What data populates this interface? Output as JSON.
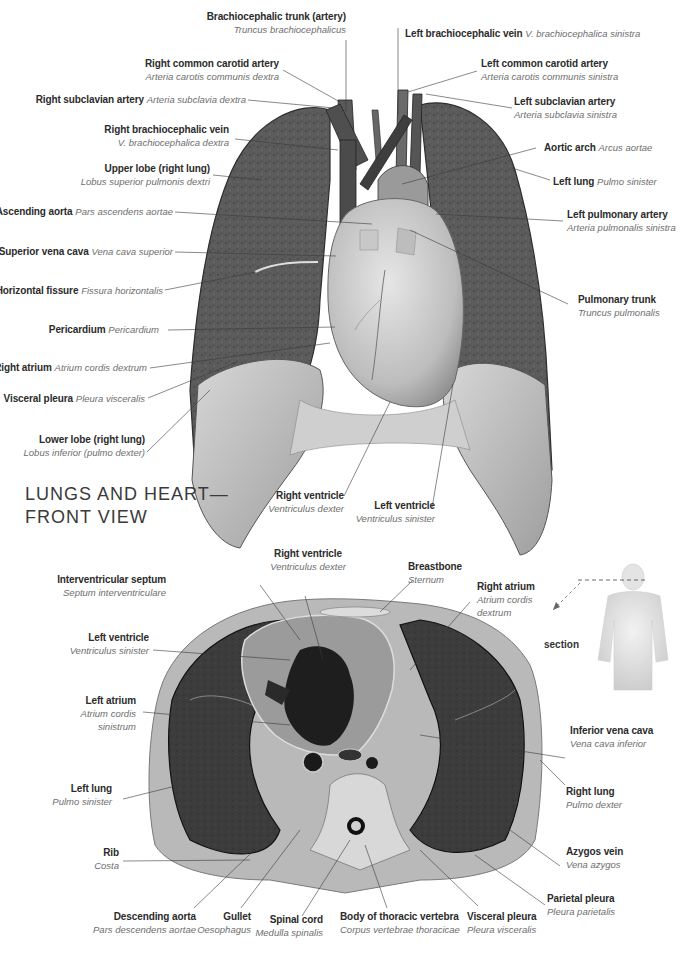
{
  "front_view": {
    "title_line1": "LUNGS AND HEART—",
    "title_line2": "FRONT VIEW",
    "labels": [
      {
        "id": "brachiocephalic-trunk",
        "en": "Brachiocephalic trunk (artery)",
        "la": "Truncus brachiocephalicus"
      },
      {
        "id": "right-common-carotid",
        "en": "Right common carotid artery",
        "la": "Arteria carotis communis dextra"
      },
      {
        "id": "right-subclavian",
        "en": "Right subclavian artery",
        "la": "Arteria subclavia dextra"
      },
      {
        "id": "right-brachiocephalic-vein",
        "en": "Right brachiocephalic vein",
        "la": "V. brachiocephalica dextra"
      },
      {
        "id": "upper-lobe",
        "en": "Upper lobe (right lung)",
        "la": "Lobus superior pulmonis dextri"
      },
      {
        "id": "ascending-aorta",
        "en": "Ascending aorta",
        "la": "Pars ascendens aortae"
      },
      {
        "id": "superior-vena-cava",
        "en": "Superior vena cava",
        "la": "Vena cava superior"
      },
      {
        "id": "horizontal-fissure",
        "en": "Horizontal fissure",
        "la": "Fissura horizontalis"
      },
      {
        "id": "pericardium",
        "en": "Pericardium",
        "la": "Pericardium"
      },
      {
        "id": "right-atrium",
        "en": "Right atrium",
        "la": "Atrium cordis dextrum"
      },
      {
        "id": "visceral-pleura",
        "en": "Visceral pleura",
        "la": "Pleura visceralis"
      },
      {
        "id": "lower-lobe",
        "en": "Lower lobe (right lung)",
        "la": "Lobus inferior (pulmo dexter)"
      },
      {
        "id": "left-brachiocephalic-vein",
        "en": "Left brachiocephalic vein",
        "la": "V. brachiocephalica sinistra"
      },
      {
        "id": "left-common-carotid",
        "en": "Left common carotid artery",
        "la": "Arteria carotis communis sinistra"
      },
      {
        "id": "left-subclavian",
        "en": "Left subclavian artery",
        "la": "Arteria subclavia sinistra"
      },
      {
        "id": "aortic-arch",
        "en": "Aortic arch",
        "la": "Arcus aortae"
      },
      {
        "id": "left-lung",
        "en": "Left lung",
        "la": "Pulmo sinister"
      },
      {
        "id": "left-pulmonary-artery",
        "en": "Left pulmonary artery",
        "la": "Arteria pulmonalis sinistra"
      },
      {
        "id": "pulmonary-trunk",
        "en": "Pulmonary trunk",
        "la": "Truncus pulmonalis"
      },
      {
        "id": "right-ventricle",
        "en": "Right ventricle",
        "la": "Ventriculus dexter"
      },
      {
        "id": "left-ventricle",
        "en": "Left ventricle",
        "la": "Ventriculus sinister"
      }
    ]
  },
  "cross_section": {
    "section_label": "section",
    "labels": [
      {
        "id": "right-ventricle",
        "en": "Right ventricle",
        "la": "Ventriculus dexter"
      },
      {
        "id": "interventricular-septum",
        "en": "Interventricular septum",
        "la": "Septum interventriculare"
      },
      {
        "id": "breastbone",
        "en": "Breastbone",
        "la": "Sternum"
      },
      {
        "id": "right-atrium",
        "en": "Right atrium",
        "la_1": "Atrium cordis",
        "la_2": "dextrum"
      },
      {
        "id": "left-ventricle",
        "en": "Left ventricle",
        "la": "Ventriculus sinister"
      },
      {
        "id": "left-atrium",
        "en": "Left atrium",
        "la_1": "Atrium cordis",
        "la_2": "sinistrum"
      },
      {
        "id": "inferior-vena-cava",
        "en": "Inferior vena cava",
        "la": "Vena cava inferior"
      },
      {
        "id": "left-lung",
        "en": "Left lung",
        "la": "Pulmo sinister"
      },
      {
        "id": "right-lung",
        "en": "Right lung",
        "la": "Pulmo dexter"
      },
      {
        "id": "rib",
        "en": "Rib",
        "la": "Costa"
      },
      {
        "id": "azygos-vein",
        "en": "Azygos vein",
        "la": "Vena azygos"
      },
      {
        "id": "parietal-pleura",
        "en": "Parietal pleura",
        "la": "Pleura parietalis"
      },
      {
        "id": "descending-aorta",
        "en": "Descending aorta",
        "la": "Pars descendens aortae"
      },
      {
        "id": "gullet",
        "en": "Gullet",
        "la": "Oesophagus"
      },
      {
        "id": "spinal-cord",
        "en": "Spinal cord",
        "la": "Medulla spinalis"
      },
      {
        "id": "vertebra-body",
        "en": "Body of thoracic vertebra",
        "la": "Corpus vertebrae thoracicae"
      },
      {
        "id": "visceral-pleura",
        "en": "Visceral pleura",
        "la": "Pleura visceralis"
      }
    ]
  },
  "colors": {
    "lung_tissue": "#5a5a5a",
    "lung_lower": "#b8b8b8",
    "heart": "#c9c9c9",
    "vessel": "#555555",
    "label_en": "#2b2b2b",
    "label_la": "#6e6e6e",
    "leader_line": "#3a3a3a"
  }
}
